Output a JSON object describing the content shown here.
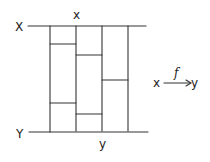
{
  "diagram": {
    "top_space_label": "X",
    "bottom_space_label": "Y",
    "top_point_label": "x",
    "bottom_point_label": "y",
    "map": {
      "source": "x",
      "arrow_label": "f",
      "target": "y"
    },
    "columns": [
      {
        "x_left": 50,
        "x_right": 76,
        "splits_y": [
          44,
          103
        ]
      },
      {
        "x_left": 76,
        "x_right": 102,
        "splits_y": [
          55,
          114
        ]
      },
      {
        "x_left": 102,
        "x_right": 128,
        "splits_y": [
          80
        ]
      }
    ],
    "colors": {
      "stroke": "#333333",
      "background": "#ffffff"
    }
  }
}
